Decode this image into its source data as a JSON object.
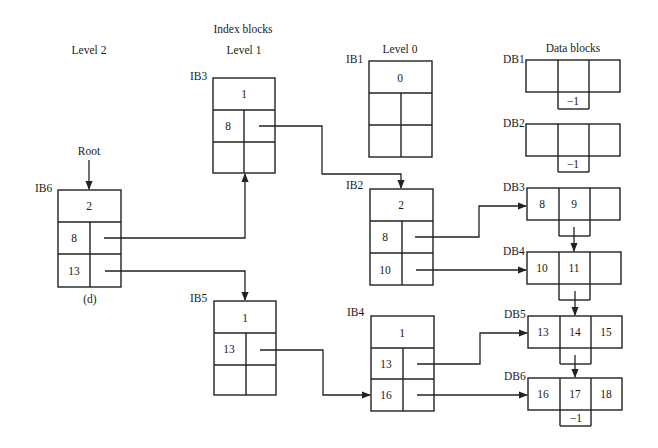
{
  "headings": {
    "index_blocks": "Index blocks",
    "level2": "Level 2",
    "level1": "Level 1",
    "level0": "Level 0",
    "data_blocks": "Data blocks",
    "root": "Root",
    "caption": "(d)"
  },
  "index_blocks": [
    {
      "id": "IB6",
      "label": "IB6",
      "level": 2,
      "header": "2",
      "rows": [
        {
          "key": "8",
          "ptr": "IB3"
        },
        {
          "key": "13",
          "ptr": "IB5"
        }
      ]
    },
    {
      "id": "IB3",
      "label": "IB3",
      "level": 1,
      "header": "1",
      "rows": [
        {
          "key": "8",
          "ptr": "IB2"
        },
        {
          "key": "",
          "ptr": ""
        }
      ]
    },
    {
      "id": "IB5",
      "label": "IB5",
      "level": 1,
      "header": "1",
      "rows": [
        {
          "key": "13",
          "ptr": "IB4"
        },
        {
          "key": "",
          "ptr": ""
        }
      ]
    },
    {
      "id": "IB1",
      "label": "IB1",
      "level": 0,
      "header": "0",
      "rows": [
        {
          "key": "",
          "ptr": ""
        },
        {
          "key": "",
          "ptr": ""
        }
      ]
    },
    {
      "id": "IB2",
      "label": "IB2",
      "level": 0,
      "header": "2",
      "rows": [
        {
          "key": "8",
          "ptr": "DB3"
        },
        {
          "key": "10",
          "ptr": "DB4"
        }
      ]
    },
    {
      "id": "IB4",
      "label": "IB4",
      "level": 0,
      "header": "1",
      "rows": [
        {
          "key": "13",
          "ptr": "DB5"
        },
        {
          "key": "16",
          "ptr": "DB6"
        }
      ]
    }
  ],
  "data_blocks": [
    {
      "id": "DB1",
      "label": "DB1",
      "cells": [
        "",
        "",
        ""
      ],
      "next": "-1"
    },
    {
      "id": "DB2",
      "label": "DB2",
      "cells": [
        "",
        "",
        ""
      ],
      "next": "-1"
    },
    {
      "id": "DB3",
      "label": "DB3",
      "cells": [
        "8",
        "9",
        ""
      ],
      "next": "DB4"
    },
    {
      "id": "DB4",
      "label": "DB4",
      "cells": [
        "10",
        "11",
        ""
      ],
      "next": "DB5"
    },
    {
      "id": "DB5",
      "label": "DB5",
      "cells": [
        "13",
        "14",
        "15"
      ],
      "next": "DB6"
    },
    {
      "id": "DB6",
      "label": "DB6",
      "cells": [
        "16",
        "17",
        "18"
      ],
      "next": "-1"
    }
  ],
  "null_pointer_text": "−1",
  "colors": {
    "stroke": "#222222",
    "text": "#1a1a1a",
    "background": "#ffffff"
  }
}
